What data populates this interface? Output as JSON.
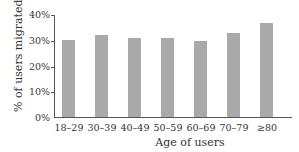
{
  "chart_data": {
    "type": "bar",
    "title": "",
    "xlabel": "Age of users",
    "ylabel": "% of users migrated",
    "categories": [
      "18–29",
      "30–39",
      "40–49",
      "50–59",
      "60–69",
      "70–79",
      "≥80"
    ],
    "values": [
      30.3,
      32.0,
      31.0,
      30.8,
      29.7,
      33.0,
      37.0
    ],
    "unit": "%",
    "ylim": [
      0,
      40
    ],
    "yticks": [
      "0%",
      "10%",
      "20%",
      "30%",
      "40%"
    ],
    "grid": false,
    "legend": null,
    "bar_color": "#a9a9a9"
  }
}
